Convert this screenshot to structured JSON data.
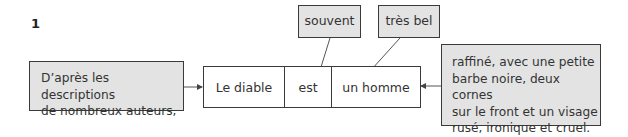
{
  "exercise_number": "1",
  "diagram": {
    "left_modifier": {
      "lines": [
        "D’après les descriptions",
        "de nombreux auteurs,"
      ],
      "points_to": "Le diable"
    },
    "core_sentence": {
      "cells": [
        {
          "label": "Le diable"
        },
        {
          "label": "est"
        },
        {
          "label": "un homme"
        }
      ]
    },
    "top_modifiers": [
      {
        "label": "souvent",
        "points_to": "est"
      },
      {
        "label": "très bel",
        "points_to": "un homme"
      }
    ],
    "right_modifier": {
      "lines": [
        "raffiné, avec une petite",
        "barbe noire, deux cornes",
        "sur le front et un visage",
        "rusé, ironique et cruel."
      ],
      "points_to": "un homme"
    }
  },
  "colors": {
    "modifier_fill": "#e3e3e3",
    "core_fill": "#ffffff",
    "border": "#3a3a3a"
  }
}
